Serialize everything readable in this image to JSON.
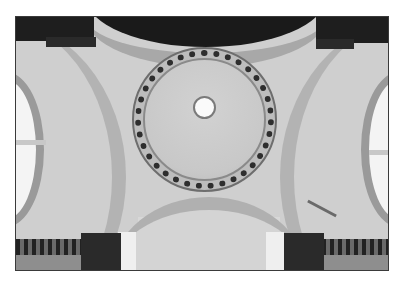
{
  "image": {
    "subject": "domed ceiling with central oculus",
    "palette": {
      "plaster": "#cfcfcf",
      "arch_band": "#b3b3b3",
      "dark_cornice": "#1e1e1e",
      "window_light": "#f4f4f4",
      "border": "#ffffff"
    }
  }
}
